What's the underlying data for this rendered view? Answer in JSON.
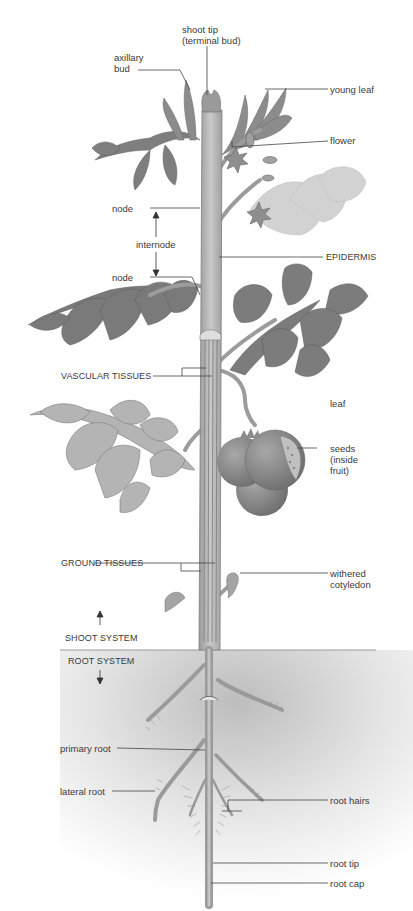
{
  "diagram": {
    "colors": {
      "background": "#ffffff",
      "leaf_dark": "#7b7b7b",
      "leaf_light": "#a8a8a8",
      "leaf_faded": "#cfcfcf",
      "stem": "#a9a9a9",
      "stem_highlight": "#c8c8c8",
      "fruit": "#8a8a8a",
      "soil_shade": "#c4c4c4",
      "label_text": "#3a3a3a",
      "leader_line": "#444444"
    },
    "labels": {
      "shoot_tip": "shoot tip\n(terminal bud)",
      "axillary_bud": "axillary\nbud",
      "young_leaf": "young leaf",
      "flower": "flower",
      "node_upper": "node",
      "internode": "internode",
      "node_lower": "node",
      "epidermis": "EPIDERMIS",
      "vascular_tissues": "VASCULAR TISSUES",
      "leaf": "leaf",
      "seeds": "seeds\n(inside\nfruit)",
      "ground_tissues": "GROUND TISSUES",
      "withered_cotyledon": "withered\ncotyledon",
      "shoot_system": "SHOOT SYSTEM",
      "root_system": "ROOT SYSTEM",
      "primary_root": "primary root",
      "lateral_root": "lateral root",
      "root_hairs": "root hairs",
      "root_tip": "root tip",
      "root_cap": "root cap"
    }
  }
}
